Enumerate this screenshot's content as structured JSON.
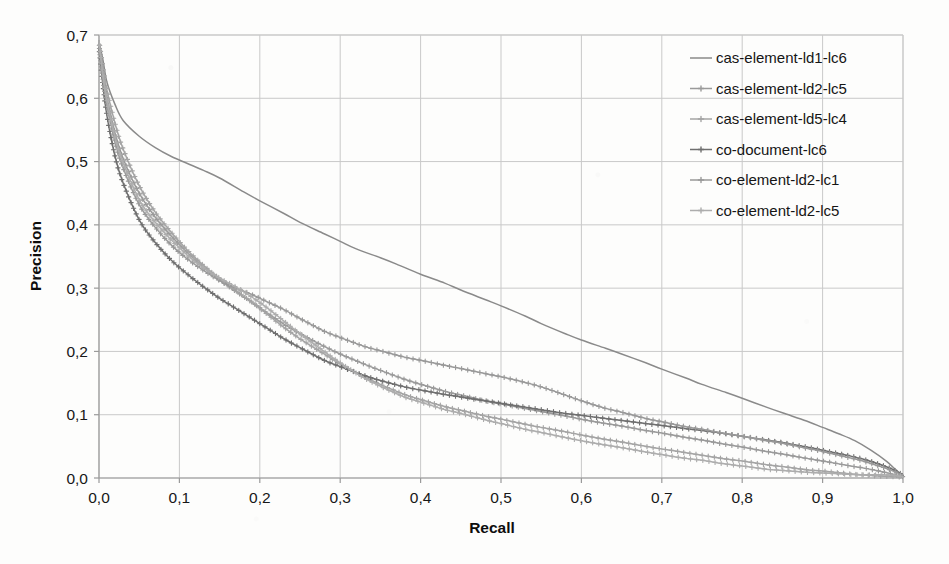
{
  "chart_data": {
    "type": "line",
    "title": "",
    "xlabel": "Recall",
    "ylabel": "Precision",
    "xlim": [
      0.0,
      1.0
    ],
    "ylim": [
      0.0,
      0.7
    ],
    "grid": true,
    "legend_position": "upper-right",
    "xticks": [
      "0,0",
      "0,1",
      "0,2",
      "0,3",
      "0,4",
      "0,5",
      "0,6",
      "0,7",
      "0,8",
      "0,9",
      "1,0"
    ],
    "xtick_values": [
      0.0,
      0.1,
      0.2,
      0.3,
      0.4,
      0.5,
      0.6,
      0.7,
      0.8,
      0.9,
      1.0
    ],
    "yticks": [
      "0,0",
      "0,1",
      "0,2",
      "0,3",
      "0,4",
      "0,5",
      "0,6",
      "0,7"
    ],
    "ytick_values": [
      0.0,
      0.1,
      0.2,
      0.3,
      0.4,
      0.5,
      0.6,
      0.7
    ],
    "decimal_separator": ",",
    "series": [
      {
        "name": "cas-element-ld1-lc6",
        "color": "#8a8a8a",
        "marker": "none",
        "x": [
          0.0,
          0.005,
          0.01,
          0.02,
          0.03,
          0.05,
          0.07,
          0.09,
          0.11,
          0.13,
          0.15,
          0.18,
          0.2,
          0.23,
          0.25,
          0.28,
          0.3,
          0.32,
          0.35,
          0.37,
          0.4,
          0.43,
          0.45,
          0.48,
          0.5,
          0.53,
          0.55,
          0.58,
          0.6,
          0.63,
          0.65,
          0.68,
          0.7,
          0.73,
          0.75,
          0.78,
          0.8,
          0.83,
          0.85,
          0.88,
          0.9,
          0.92,
          0.94,
          0.96,
          0.98,
          0.99,
          1.0
        ],
        "y": [
          0.69,
          0.66,
          0.625,
          0.59,
          0.565,
          0.54,
          0.522,
          0.508,
          0.497,
          0.486,
          0.474,
          0.452,
          0.438,
          0.418,
          0.404,
          0.386,
          0.374,
          0.362,
          0.348,
          0.338,
          0.322,
          0.308,
          0.297,
          0.282,
          0.272,
          0.256,
          0.244,
          0.228,
          0.218,
          0.205,
          0.196,
          0.182,
          0.172,
          0.158,
          0.148,
          0.135,
          0.126,
          0.112,
          0.103,
          0.09,
          0.08,
          0.07,
          0.059,
          0.044,
          0.026,
          0.014,
          0.003
        ]
      },
      {
        "name": "cas-element-ld2-lc5",
        "color": "#9a9a9a",
        "marker": "plus",
        "x": [
          0.0,
          0.005,
          0.01,
          0.02,
          0.03,
          0.05,
          0.07,
          0.09,
          0.11,
          0.13,
          0.15,
          0.17,
          0.19,
          0.21,
          0.23,
          0.25,
          0.28,
          0.3,
          0.33,
          0.35,
          0.38,
          0.4,
          0.43,
          0.45,
          0.48,
          0.5,
          0.53,
          0.55,
          0.58,
          0.6,
          0.63,
          0.65,
          0.68,
          0.7,
          0.73,
          0.75,
          0.78,
          0.8,
          0.83,
          0.85,
          0.88,
          0.9,
          0.93,
          0.95,
          0.97,
          0.99,
          1.0
        ],
        "y": [
          0.69,
          0.64,
          0.6,
          0.545,
          0.505,
          0.45,
          0.412,
          0.382,
          0.356,
          0.333,
          0.313,
          0.295,
          0.278,
          0.26,
          0.243,
          0.228,
          0.208,
          0.196,
          0.18,
          0.17,
          0.156,
          0.148,
          0.137,
          0.131,
          0.122,
          0.117,
          0.11,
          0.105,
          0.098,
          0.093,
          0.086,
          0.082,
          0.075,
          0.071,
          0.064,
          0.06,
          0.053,
          0.049,
          0.042,
          0.038,
          0.031,
          0.027,
          0.02,
          0.016,
          0.011,
          0.005,
          0.002
        ]
      },
      {
        "name": "cas-element-ld5-lc4",
        "color": "#a4a4a4",
        "marker": "plus",
        "x": [
          0.0,
          0.005,
          0.01,
          0.02,
          0.03,
          0.05,
          0.07,
          0.09,
          0.11,
          0.13,
          0.15,
          0.17,
          0.19,
          0.21,
          0.23,
          0.25,
          0.28,
          0.3,
          0.33,
          0.35,
          0.38,
          0.4,
          0.43,
          0.45,
          0.48,
          0.5,
          0.53,
          0.55,
          0.58,
          0.6,
          0.63,
          0.65,
          0.68,
          0.7,
          0.73,
          0.75,
          0.78,
          0.8,
          0.83,
          0.85,
          0.88,
          0.9,
          0.93,
          0.95,
          0.97,
          0.99,
          1.0
        ],
        "y": [
          0.69,
          0.648,
          0.612,
          0.56,
          0.52,
          0.462,
          0.42,
          0.388,
          0.36,
          0.336,
          0.315,
          0.296,
          0.278,
          0.258,
          0.238,
          0.22,
          0.196,
          0.18,
          0.16,
          0.148,
          0.132,
          0.124,
          0.113,
          0.107,
          0.098,
          0.093,
          0.085,
          0.08,
          0.073,
          0.068,
          0.061,
          0.057,
          0.05,
          0.046,
          0.04,
          0.036,
          0.03,
          0.027,
          0.021,
          0.018,
          0.013,
          0.011,
          0.007,
          0.005,
          0.003,
          0.002,
          0.001
        ]
      },
      {
        "name": "co-document-lc6",
        "color": "#6f6f6f",
        "marker": "plus",
        "x": [
          0.0,
          0.005,
          0.01,
          0.02,
          0.03,
          0.05,
          0.07,
          0.09,
          0.11,
          0.13,
          0.15,
          0.17,
          0.19,
          0.21,
          0.23,
          0.25,
          0.28,
          0.3,
          0.33,
          0.35,
          0.38,
          0.4,
          0.43,
          0.45,
          0.48,
          0.5,
          0.53,
          0.55,
          0.58,
          0.6,
          0.63,
          0.65,
          0.68,
          0.7,
          0.73,
          0.75,
          0.78,
          0.8,
          0.83,
          0.85,
          0.88,
          0.9,
          0.93,
          0.95,
          0.97,
          0.99,
          1.0
        ],
        "y": [
          0.68,
          0.62,
          0.572,
          0.508,
          0.466,
          0.408,
          0.372,
          0.344,
          0.322,
          0.302,
          0.284,
          0.268,
          0.252,
          0.236,
          0.22,
          0.206,
          0.186,
          0.176,
          0.162,
          0.154,
          0.144,
          0.139,
          0.132,
          0.128,
          0.122,
          0.118,
          0.112,
          0.108,
          0.102,
          0.099,
          0.094,
          0.091,
          0.086,
          0.083,
          0.078,
          0.075,
          0.07,
          0.066,
          0.06,
          0.056,
          0.049,
          0.044,
          0.036,
          0.03,
          0.022,
          0.012,
          0.004
        ]
      },
      {
        "name": "co-element-ld2-lc1",
        "color": "#999999",
        "marker": "plus",
        "x": [
          0.0,
          0.005,
          0.01,
          0.02,
          0.03,
          0.05,
          0.07,
          0.09,
          0.11,
          0.13,
          0.15,
          0.17,
          0.19,
          0.21,
          0.23,
          0.25,
          0.28,
          0.3,
          0.33,
          0.35,
          0.38,
          0.4,
          0.43,
          0.45,
          0.48,
          0.5,
          0.53,
          0.55,
          0.58,
          0.6,
          0.63,
          0.65,
          0.68,
          0.7,
          0.73,
          0.75,
          0.78,
          0.8,
          0.83,
          0.85,
          0.88,
          0.9,
          0.93,
          0.95,
          0.97,
          0.99,
          1.0
        ],
        "y": [
          0.685,
          0.63,
          0.59,
          0.53,
          0.49,
          0.432,
          0.396,
          0.368,
          0.346,
          0.328,
          0.312,
          0.3,
          0.29,
          0.278,
          0.266,
          0.252,
          0.232,
          0.222,
          0.208,
          0.201,
          0.191,
          0.186,
          0.178,
          0.173,
          0.165,
          0.16,
          0.151,
          0.144,
          0.131,
          0.122,
          0.11,
          0.104,
          0.094,
          0.089,
          0.081,
          0.077,
          0.07,
          0.066,
          0.059,
          0.055,
          0.047,
          0.042,
          0.033,
          0.027,
          0.019,
          0.01,
          0.003
        ]
      },
      {
        "name": "co-element-ld2-lc5",
        "color": "#adadad",
        "marker": "plus",
        "x": [
          0.0,
          0.005,
          0.01,
          0.02,
          0.03,
          0.05,
          0.07,
          0.09,
          0.11,
          0.13,
          0.15,
          0.17,
          0.19,
          0.21,
          0.23,
          0.25,
          0.28,
          0.3,
          0.33,
          0.35,
          0.38,
          0.4,
          0.43,
          0.45,
          0.48,
          0.5,
          0.53,
          0.55,
          0.58,
          0.6,
          0.63,
          0.65,
          0.68,
          0.7,
          0.73,
          0.75,
          0.78,
          0.8,
          0.83,
          0.85,
          0.88,
          0.9,
          0.93,
          0.95,
          0.97,
          0.99,
          1.0
        ],
        "y": [
          0.69,
          0.636,
          0.596,
          0.538,
          0.498,
          0.44,
          0.404,
          0.376,
          0.352,
          0.332,
          0.316,
          0.302,
          0.286,
          0.268,
          0.248,
          0.228,
          0.2,
          0.182,
          0.158,
          0.145,
          0.128,
          0.12,
          0.108,
          0.102,
          0.092,
          0.086,
          0.077,
          0.072,
          0.064,
          0.059,
          0.052,
          0.048,
          0.041,
          0.037,
          0.031,
          0.028,
          0.022,
          0.019,
          0.014,
          0.012,
          0.009,
          0.008,
          0.006,
          0.005,
          0.005,
          0.004,
          0.002
        ]
      }
    ]
  },
  "legend": {
    "items": [
      {
        "label": "cas-element-ld1-lc6"
      },
      {
        "label": "cas-element-ld2-lc5"
      },
      {
        "label": "cas-element-ld5-lc4"
      },
      {
        "label": "co-document-lc6"
      },
      {
        "label": "co-element-ld2-lc1"
      },
      {
        "label": "co-element-ld2-lc5"
      }
    ]
  }
}
